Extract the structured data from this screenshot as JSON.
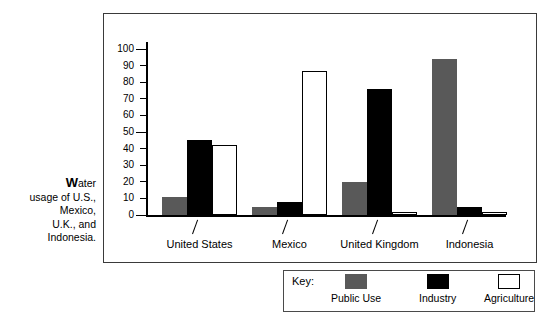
{
  "caption": {
    "dropcap": "W",
    "rest": "ater",
    "lines": [
      "usage of U.S.,",
      "Mexico,",
      "U.K., and",
      "Indonesia."
    ]
  },
  "legend": {
    "title": "Key:",
    "items": [
      {
        "label": "Public Use",
        "color": "#595959",
        "swatch": "public"
      },
      {
        "label": "Industry",
        "color": "#000000",
        "swatch": "industry"
      },
      {
        "label": "Agriculture",
        "color": "#ffffff",
        "swatch": "agri"
      }
    ]
  },
  "chart_data": {
    "type": "bar",
    "title": "Water usage of U.S., Mexico, U.K., and Indonesia.",
    "xlabel": "",
    "ylabel": "",
    "ylim": [
      0,
      100
    ],
    "yticks": [
      0,
      10,
      20,
      30,
      40,
      50,
      60,
      70,
      80,
      90,
      100
    ],
    "ytick_labels": [
      "0",
      "10",
      "20",
      "30",
      "40",
      "50",
      "60",
      "70",
      "80",
      "90",
      "100"
    ],
    "grid": false,
    "legend_position": "bottom-right",
    "categories": [
      "United States",
      "Mexico",
      "United Kingdom",
      "Indonesia"
    ],
    "series": [
      {
        "name": "Public Use",
        "color": "#595959",
        "values": [
          11,
          5,
          20,
          94
        ]
      },
      {
        "name": "Industry",
        "color": "#000000",
        "values": [
          45,
          8,
          76,
          5
        ]
      },
      {
        "name": "Agriculture",
        "color": "#ffffff",
        "values": [
          42,
          87,
          2,
          2
        ]
      }
    ]
  }
}
